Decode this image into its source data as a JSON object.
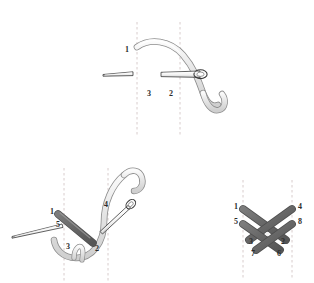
{
  "canvas": {
    "width": 314,
    "height": 283,
    "background": "#ffffff"
  },
  "colors": {
    "thread_fill": "#e6e6e6",
    "thread_edge": "#8a8a8a",
    "needle_fill": "#ffffff",
    "needle_edge": "#3a3a3a",
    "stitch_gray": "#6d6d6d",
    "stitch_dark": "#585858",
    "guide_line": "#d8cccc",
    "label_text": "#2b2b2b"
  },
  "figure": {
    "title": "",
    "caption": "",
    "panels": [
      {
        "id": "panel-top",
        "name": "step-1-needle-entering-fabric",
        "labels": [
          {
            "id": "t1",
            "text": "1",
            "x": 128,
            "y": 49
          },
          {
            "id": "t3",
            "text": "3",
            "x": 149,
            "y": 95
          },
          {
            "id": "t2",
            "text": "2",
            "x": 171,
            "y": 95
          }
        ],
        "guides": [
          {
            "id": "g-left",
            "x": 137,
            "y1": 22,
            "y2": 136
          },
          {
            "id": "g-right",
            "x": 180,
            "y1": 22,
            "y2": 136
          }
        ]
      },
      {
        "id": "panel-bottom-left",
        "name": "step-2-first-diagonal-stitch",
        "labels": [
          {
            "id": "b1",
            "text": "1",
            "x": 52,
            "y": 212
          },
          {
            "id": "b5",
            "text": "5",
            "x": 58,
            "y": 226
          },
          {
            "id": "b3",
            "text": "3",
            "x": 68,
            "y": 247
          },
          {
            "id": "b2",
            "text": "2",
            "x": 97,
            "y": 249
          },
          {
            "id": "b4",
            "text": "4",
            "x": 106,
            "y": 205
          }
        ],
        "guides": [
          {
            "id": "g-left",
            "x": 64,
            "y1": 168,
            "y2": 283
          },
          {
            "id": "g-right",
            "x": 108,
            "y1": 168,
            "y2": 283
          }
        ]
      },
      {
        "id": "panel-bottom-right",
        "name": "step-3-completed-cross-stitches",
        "labels": [
          {
            "id": "c1",
            "text": "1",
            "x": 236,
            "y": 206
          },
          {
            "id": "c4",
            "text": "4",
            "x": 300,
            "y": 206
          },
          {
            "id": "c5",
            "text": "5",
            "x": 236,
            "y": 221
          },
          {
            "id": "c8",
            "text": "8",
            "x": 300,
            "y": 221
          },
          {
            "id": "c3",
            "text": "3",
            "x": 251,
            "y": 241
          },
          {
            "id": "c2",
            "text": "2",
            "x": 283,
            "y": 241
          },
          {
            "id": "c7",
            "text": "7",
            "x": 253,
            "y": 253
          },
          {
            "id": "c6",
            "text": "6",
            "x": 279,
            "y": 253
          }
        ],
        "guides": [
          {
            "id": "g-left",
            "x": 243,
            "y1": 180,
            "y2": 278
          },
          {
            "id": "g-right",
            "x": 292,
            "y1": 180,
            "y2": 278
          }
        ]
      }
    ]
  },
  "icons": {
    "needle": "sewing-needle-icon",
    "thread": "thread-strand-icon",
    "guide": "dashed-guide-line-icon",
    "stitch": "diagonal-stitch-icon"
  }
}
